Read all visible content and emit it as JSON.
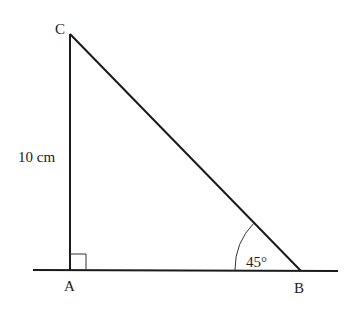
{
  "diagram": {
    "type": "right-triangle",
    "vertices": {
      "A": {
        "label": "A"
      },
      "B": {
        "label": "B"
      },
      "C": {
        "label": "C"
      }
    },
    "side_AC_label": "10 cm",
    "angle_B_label": "45°",
    "right_angle_at": "A",
    "colors": {
      "stroke": "#1a1a1a",
      "text": "#222222",
      "background": "#ffffff"
    }
  }
}
